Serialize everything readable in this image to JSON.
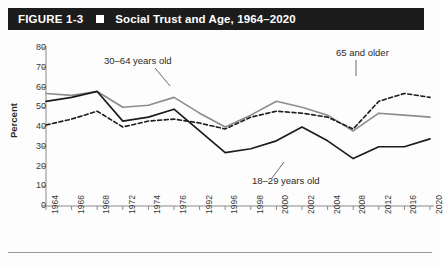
{
  "figure": {
    "number_label": "FIGURE 1-3",
    "separator_icon": "square-bullet-icon",
    "title": "Social Trust and Age, 1964–2020"
  },
  "chart_data": {
    "type": "line",
    "title": "Social Trust and Age, 1964–2020",
    "xlabel": "",
    "ylabel": "Percent",
    "ylim": [
      0,
      80
    ],
    "ytick_step": 10,
    "yticks": [
      "80",
      "70",
      "60",
      "50",
      "40",
      "30",
      "20",
      "10",
      "0"
    ],
    "grid": false,
    "legend_position": "inline-annotations",
    "categories": [
      "1964",
      "1966",
      "1968",
      "1972",
      "1974",
      "1976",
      "1992",
      "1996",
      "1998",
      "2000",
      "2002",
      "2004",
      "2008",
      "2012",
      "2016",
      "2020"
    ],
    "series": [
      {
        "name": "30–64 years old",
        "style": "solid",
        "color": "#8c8c8c",
        "width": 1.6,
        "values": [
          57,
          56,
          58,
          50,
          51,
          55,
          47,
          40,
          46,
          53,
          50,
          46,
          38,
          47,
          46,
          45
        ]
      },
      {
        "name": "65 and older",
        "style": "dashed",
        "color": "#1c1c1c",
        "width": 1.6,
        "values": [
          41,
          44,
          48,
          40,
          43,
          44,
          42,
          39,
          45,
          48,
          47,
          45,
          39,
          53,
          57,
          55
        ]
      },
      {
        "name": "18–29 years old",
        "style": "solid",
        "color": "#1c1c1c",
        "width": 1.7,
        "values": [
          53,
          55,
          58,
          43,
          45,
          49,
          38,
          27,
          29,
          33,
          40,
          33,
          24,
          30,
          30,
          34
        ]
      }
    ],
    "annotations": [
      {
        "text": "30–64 years old",
        "series": "30–64 years old"
      },
      {
        "text": "65 and older",
        "series": "65 and older"
      },
      {
        "text": "18–29 years old",
        "series": "18–29 years old"
      }
    ]
  },
  "colors": {
    "title_bar_background": "#1c1c1c",
    "title_text": "#ffffff",
    "axis": "#8a8a8a",
    "tick_text": "#3a3a3a",
    "series_gray": "#8c8c8c",
    "series_black": "#1c1c1c",
    "page_background": "#ffffff"
  }
}
